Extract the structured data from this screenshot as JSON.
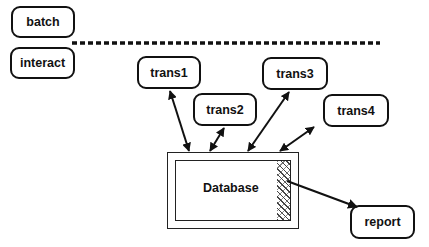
{
  "diagram": {
    "colors": {
      "stroke": "#111111",
      "background": "#ffffff"
    },
    "nodes": {
      "batch": {
        "label": "batch"
      },
      "interact": {
        "label": "interact"
      },
      "trans1": {
        "label": "trans1"
      },
      "trans2": {
        "label": "trans2"
      },
      "trans3": {
        "label": "trans3"
      },
      "trans4": {
        "label": "trans4"
      },
      "database": {
        "label": "Database"
      },
      "report": {
        "label": "report"
      }
    },
    "separator": {
      "style": "dashed",
      "between": [
        "batch",
        "interact"
      ]
    },
    "edges": [
      {
        "from": "trans1",
        "to": "database",
        "direction": "bidirectional"
      },
      {
        "from": "trans2",
        "to": "database",
        "direction": "bidirectional"
      },
      {
        "from": "trans3",
        "to": "database",
        "direction": "bidirectional"
      },
      {
        "from": "trans4",
        "to": "database",
        "direction": "bidirectional"
      },
      {
        "from": "database",
        "to": "report",
        "direction": "forward"
      }
    ]
  }
}
